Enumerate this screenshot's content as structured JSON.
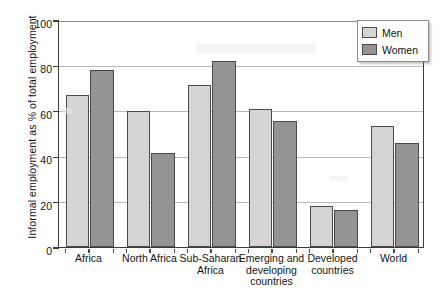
{
  "chart_data": {
    "type": "bar",
    "title": "",
    "xlabel": "",
    "ylabel": "Informal employment as % of total employment",
    "ylim": [
      0,
      100
    ],
    "yticks": [
      0,
      20,
      40,
      60,
      80,
      100
    ],
    "grid": true,
    "legend_position": "top-right",
    "categories": [
      "Africa",
      "North Africa",
      "Sub-Saharan Africa",
      "Emerging and developing countries",
      "Developed countries",
      "World"
    ],
    "category_lines": [
      [
        "Africa"
      ],
      [
        "North Africa"
      ],
      [
        "Sub-Saharan",
        "Africa"
      ],
      [
        "Emerging and",
        "developing",
        "countries"
      ],
      [
        "Developed",
        "countries"
      ],
      [
        "World"
      ]
    ],
    "series": [
      {
        "name": "Men",
        "color": "#d5d5d5",
        "values": [
          67,
          60,
          71.5,
          61,
          18,
          53.5
        ]
      },
      {
        "name": "Women",
        "color": "#949494",
        "values": [
          78,
          41.5,
          82,
          55.5,
          16.5,
          46
        ]
      }
    ]
  },
  "legend": {
    "items": [
      {
        "label": "Men"
      },
      {
        "label": "Women"
      }
    ]
  },
  "axis": {
    "y_tick_labels": [
      "100",
      "80",
      "60",
      "40",
      "20",
      "0"
    ]
  }
}
